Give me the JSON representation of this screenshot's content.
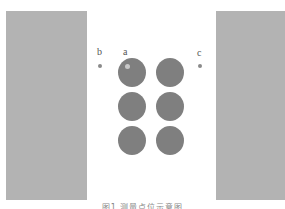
{
  "figure": {
    "labels": {
      "a": "a",
      "b": "b",
      "c": "c"
    },
    "caption": "图1  测量点位示意图",
    "colors": {
      "panel": "#b3b3b3",
      "circle": "#7f7f7f",
      "point": "#8a8a8a",
      "highlight": "#c8c8c8",
      "background": "#ffffff"
    },
    "circles": {
      "rows": 3,
      "columns": 2,
      "count": 6
    }
  }
}
